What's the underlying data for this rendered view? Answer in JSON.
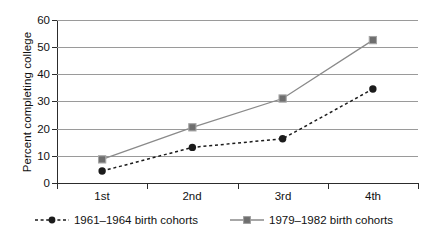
{
  "chart_data": {
    "type": "line",
    "title": "",
    "xlabel": "",
    "ylabel": "Percent completing college",
    "categories": [
      "1st",
      "2nd",
      "3rd",
      "4th"
    ],
    "ylim": [
      0,
      60
    ],
    "yticks": [
      0,
      10,
      20,
      30,
      40,
      50,
      60
    ],
    "grid": true,
    "legend_position": "bottom",
    "series": [
      {
        "name": "1961–1964 birth cohorts",
        "values": [
          4.4,
          13.1,
          16.3,
          34.6
        ],
        "marker": "circle",
        "line_style": "dashed",
        "color": "#1b1b1b"
      },
      {
        "name": "1979–1982 birth cohorts",
        "values": [
          8.7,
          20.5,
          31.1,
          52.6
        ],
        "marker": "square",
        "line_style": "solid",
        "color": "#6e6e6e"
      }
    ]
  },
  "axis": {
    "y_tick_labels": [
      "60",
      "50",
      "40",
      "30",
      "20",
      "10",
      "0"
    ],
    "y_title": "Percent completing college",
    "x_tick_labels": [
      "1st",
      "2nd",
      "3rd",
      "4th"
    ]
  },
  "legend": {
    "items": [
      {
        "label": "1961–1964 birth cohorts",
        "marker": "filled-circle-marker",
        "style": "dashed"
      },
      {
        "label": "1979–1982 birth cohorts",
        "marker": "filled-square-marker",
        "style": "solid"
      }
    ]
  },
  "colors": {
    "series_1": "#1b1b1b",
    "series_2": "#6e6e6e",
    "gridline": "#9a9a9a",
    "axis": "#2c2c2c",
    "background": "#ffffff"
  }
}
